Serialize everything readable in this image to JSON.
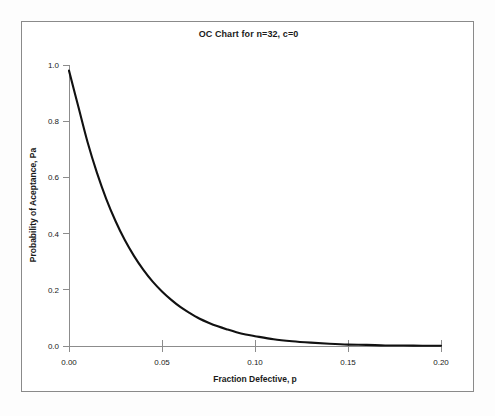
{
  "figure": {
    "title": "OC Chart for n=32, c=0",
    "frame_color": "#8a8a8a",
    "background": "#ffffff",
    "curve_color": "#111111",
    "axis_color": "#8c8c8c"
  },
  "chart_data": {
    "type": "line",
    "title": "OC Chart for n=32, c=0",
    "subtitle": "",
    "xlabel": "Fraction Defective, p",
    "ylabel": "Probability of Aceptance, Pa",
    "xlim": [
      0.0,
      0.2
    ],
    "ylim": [
      0.0,
      1.0
    ],
    "grid": false,
    "legend": null,
    "xticks": [
      0.0,
      0.05,
      0.1,
      0.15,
      0.2
    ],
    "xtick_labels": [
      "0.00",
      "0.05",
      "0.10",
      "0.15",
      "0.20"
    ],
    "yticks": [
      0.0,
      0.2,
      0.4,
      0.6,
      0.8,
      1.0
    ],
    "ytick_labels": [
      "0.0",
      "0.2",
      "0.4",
      "0.6",
      "0.8",
      "1.0"
    ],
    "sample_size_n": 32,
    "acceptance_number_c": 0,
    "formula": "Pa = (1 - p)^32",
    "series": [
      {
        "name": "Pa = (1-p)^32",
        "x": [
          0.0,
          0.005,
          0.01,
          0.015,
          0.02,
          0.025,
          0.03,
          0.035,
          0.04,
          0.045,
          0.05,
          0.055,
          0.06,
          0.065,
          0.07,
          0.075,
          0.08,
          0.085,
          0.09,
          0.095,
          0.1,
          0.11,
          0.12,
          0.13,
          0.14,
          0.15,
          0.16,
          0.17,
          0.18,
          0.19,
          0.2
        ],
        "values": [
          0.98,
          0.852,
          0.725,
          0.617,
          0.524,
          0.445,
          0.377,
          0.32,
          0.271,
          0.229,
          0.194,
          0.164,
          0.138,
          0.117,
          0.098,
          0.083,
          0.07,
          0.059,
          0.049,
          0.041,
          0.035,
          0.024,
          0.017,
          0.012,
          0.008,
          0.005,
          0.004,
          0.002,
          0.002,
          0.001,
          0.001
        ]
      }
    ]
  }
}
